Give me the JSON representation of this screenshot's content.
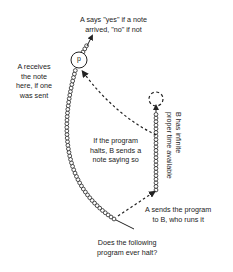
{
  "diagram": {
    "labels": {
      "a_says": [
        "A says \"yes\" if a note",
        "arrived, \"no\" if not"
      ],
      "a_receives": [
        "A receives",
        "the note",
        "here, if one",
        "was sent"
      ],
      "if_halts": [
        "If the program",
        "halts, B sends a",
        "note saying so"
      ],
      "b_infinite": [
        "B has infinite",
        "proper time available"
      ],
      "a_sends": [
        "A sends the program",
        "to B, who runs it"
      ],
      "question": [
        "Does the following",
        "program ever halt?"
      ],
      "point": "p"
    },
    "colors": {
      "stroke": "#222222",
      "background": "#ffffff"
    }
  }
}
